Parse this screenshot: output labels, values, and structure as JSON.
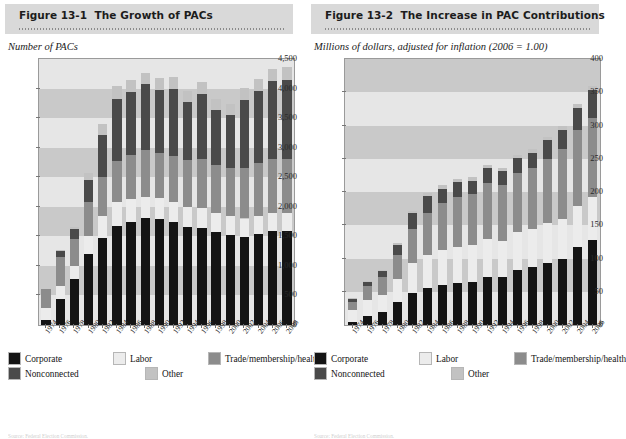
{
  "figures": [
    {
      "id": "figure-13-1",
      "number": "Figure 13-1",
      "title": "The Growth of PACs",
      "axis_title": "Number of PACs",
      "source": "Source: Federal Election Commission."
    },
    {
      "id": "figure-13-2",
      "number": "Figure 13-2",
      "title": "The Increase in PAC Contributions",
      "axis_title": "Millions of dollars, adjusted for inflation (2006 = 1.00)",
      "source": "Source: Federal Election Commission."
    }
  ],
  "legend": {
    "items": [
      {
        "label": "Corporate",
        "color": "#141414"
      },
      {
        "label": "Labor",
        "color": "#ececec"
      },
      {
        "label": "Trade/membership/health",
        "color": "#8c8c8c"
      },
      {
        "label": "Nonconnected",
        "color": "#4a4a4a"
      },
      {
        "label": "Other",
        "color": "#c2c2c2"
      }
    ],
    "row_positions": [
      [
        0,
        105,
        200
      ],
      [
        0,
        137
      ]
    ]
  },
  "chart_data": [
    {
      "type": "bar",
      "stacked": true,
      "title": "The Growth of PACs",
      "xlabel": "",
      "ylabel": "Number of PACs",
      "ylim": [
        0,
        4500
      ],
      "yticks": [
        0,
        500,
        1000,
        1500,
        2000,
        2500,
        3000,
        3500,
        4000,
        4500
      ],
      "ytick_labels": [
        "0",
        "500",
        "1,000",
        "1,500",
        "2,000",
        "2,500",
        "3,000",
        "3,500",
        "4,000",
        "4,500"
      ],
      "grid": "horizontal-bands",
      "legend_position": "below",
      "categories": [
        "1974",
        "1976",
        "1978",
        "1980",
        "1982",
        "1984",
        "1986",
        "1988",
        "1990",
        "1992",
        "1994",
        "1996",
        "1998",
        "2000",
        "2002",
        "2004",
        "2006",
        "2008"
      ],
      "series": [
        {
          "name": "Corporate",
          "color": "#141414",
          "values": [
            89,
            433,
            785,
            1206,
            1469,
            1682,
            1744,
            1816,
            1795,
            1735,
            1660,
            1642,
            1567,
            1523,
            1497,
            1538,
            1597,
            1598
          ]
        },
        {
          "name": "Labor",
          "color": "#ececec",
          "values": [
            201,
            224,
            217,
            297,
            380,
            394,
            384,
            354,
            346,
            347,
            333,
            332,
            321,
            316,
            305,
            302,
            302,
            303
          ]
        },
        {
          "name": "Trade/membership/health",
          "color": "#8c8c8c",
          "values": [
            318,
            489,
            453,
            576,
            649,
            698,
            745,
            786,
            774,
            770,
            792,
            838,
            821,
            812,
            855,
            896,
            904,
            915
          ]
        },
        {
          "name": "Nonconnected",
          "color": "#4a4a4a",
          "values": [
            0,
            110,
            165,
            374,
            723,
            1053,
            1077,
            1115,
            1062,
            1145,
            980,
            1103,
            935,
            902,
            1147,
            1222,
            1328,
            1331
          ]
        },
        {
          "name": "Other",
          "color": "#c2c2c2",
          "values": [
            0,
            10,
            31,
            123,
            173,
            212,
            198,
            196,
            195,
            197,
            187,
            194,
            185,
            194,
            200,
            202,
            208,
            212
          ]
        }
      ]
    },
    {
      "type": "bar",
      "stacked": true,
      "title": "The Increase in PAC Contributions",
      "xlabel": "",
      "ylabel": "Millions of dollars, adjusted for inflation (2006 = 1.00)",
      "ylim": [
        0,
        400
      ],
      "yticks": [
        0,
        50,
        100,
        150,
        200,
        250,
        300,
        350,
        400
      ],
      "ytick_labels": [
        "0",
        "50",
        "100",
        "150",
        "200",
        "250",
        "300",
        "350",
        "400"
      ],
      "grid": "horizontal-bands",
      "legend_position": "below",
      "categories": [
        "1974",
        "1976",
        "1978",
        "1980",
        "1982",
        "1984",
        "1986",
        "1988",
        "1990",
        "1992",
        "1994",
        "1996",
        "1998",
        "2000",
        "2002",
        "2004",
        "2006"
      ],
      "series": [
        {
          "name": "Corporate",
          "color": "#141414",
          "values": [
            5,
            14,
            20,
            35,
            48,
            56,
            60,
            63,
            65,
            72,
            72,
            83,
            87,
            93,
            99,
            117,
            128
          ]
        },
        {
          "name": "Labor",
          "color": "#ececec",
          "values": [
            18,
            24,
            25,
            34,
            45,
            50,
            53,
            54,
            55,
            58,
            55,
            57,
            57,
            60,
            61,
            62,
            64
          ]
        },
        {
          "name": "Trade/membership/health",
          "color": "#8c8c8c",
          "values": [
            12,
            21,
            27,
            37,
            52,
            62,
            70,
            75,
            77,
            84,
            84,
            89,
            92,
            97,
            104,
            114,
            120
          ]
        },
        {
          "name": "Nonconnected",
          "color": "#4a4a4a",
          "values": [
            4,
            6,
            9,
            15,
            23,
            26,
            22,
            23,
            20,
            22,
            20,
            22,
            23,
            28,
            30,
            34,
            41
          ]
        },
        {
          "name": "Other",
          "color": "#c2c2c2",
          "values": [
            1,
            1,
            2,
            3,
            4,
            5,
            5,
            5,
            5,
            5,
            5,
            5,
            5,
            5,
            6,
            6,
            7
          ]
        }
      ]
    }
  ]
}
